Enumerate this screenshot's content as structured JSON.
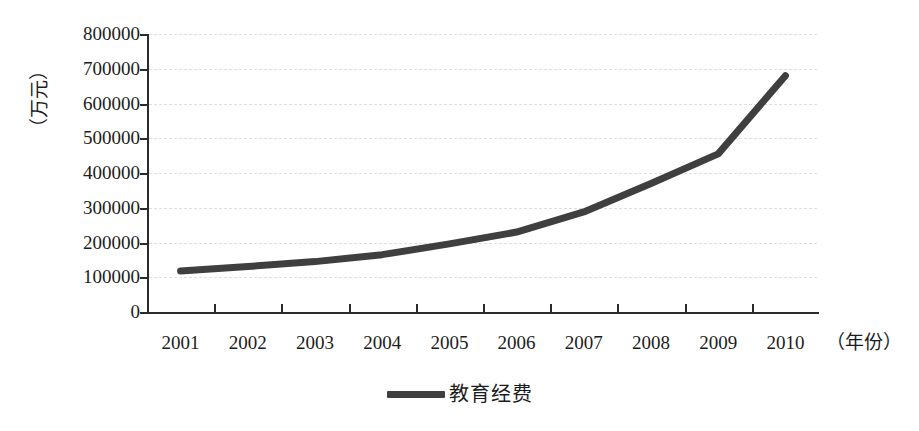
{
  "chart_data": {
    "type": "line",
    "title": "",
    "subtitle": "",
    "xlabel": "（年份）",
    "ylabel": "（万元）",
    "categories": [
      "2001",
      "2002",
      "2003",
      "2004",
      "2005",
      "2006",
      "2007",
      "2008",
      "2009",
      "2010"
    ],
    "series": [
      {
        "name": "教育经费",
        "color": "#3f3f3f",
        "values": [
          118000,
          131000,
          145000,
          165000,
          196000,
          230000,
          288000,
          370000,
          455000,
          680000
        ]
      }
    ],
    "ylim": [
      0,
      800000
    ],
    "ytick_values": [
      0,
      100000,
      200000,
      300000,
      400000,
      500000,
      600000,
      700000,
      800000
    ],
    "ytick_labels": [
      "0",
      "100000",
      "200000",
      "300000",
      "400000",
      "500000",
      "600000",
      "700000",
      "800000"
    ],
    "grid": true,
    "grid_axis": "y",
    "legend_position": "bottom",
    "legend_entries": [
      "教育经费"
    ]
  },
  "style": {
    "line_color": "#3f3f3f",
    "axis_color": "#2b2b2b",
    "grid_color": "#d9d9d9",
    "background": "#ffffff",
    "text_color": "#1c1c1c"
  }
}
